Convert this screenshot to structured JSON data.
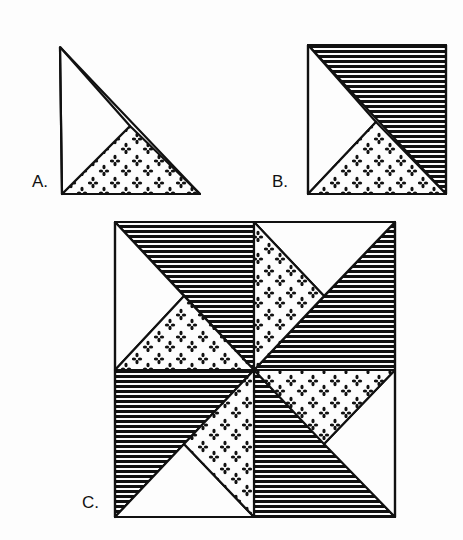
{
  "figure": {
    "labels": {
      "a": "A.",
      "b": "B.",
      "c": "C."
    },
    "colors": {
      "ink": "#111111",
      "paper": "#fdfdfd"
    },
    "descriptions": {
      "a": "Right triangle made of a plain triangle and a flowered print triangle",
      "b": "Square unit of plain, print and striped dark triangles",
      "c": "Pinwheel block of four B units rotated around the center"
    }
  }
}
